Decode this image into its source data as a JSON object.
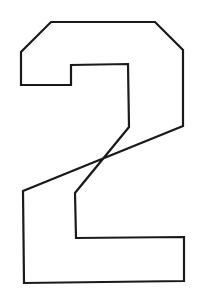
{
  "figure": {
    "digit": "2",
    "stroke_color": "#1a1a1a",
    "background_color": "#ffffff",
    "stroke_width": 2.2,
    "outline_points": "51,22 155,22 183,50 183,126 23,191 24,283 184,281 184,237 76,238 75,193 129,127 128,64 71,65 71,85 21,85 21,52"
  }
}
